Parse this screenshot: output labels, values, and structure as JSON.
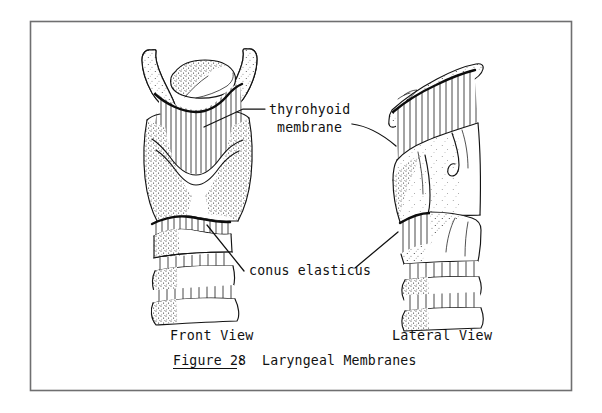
{
  "figure": {
    "border_color": "#6f6f70",
    "ink_color": "#141414",
    "background": "#ffffff",
    "annotations": {
      "thyrohyoid_line1": "thyrohyoid",
      "thyrohyoid_line2": "membrane",
      "conus": "conus elasticus"
    },
    "views": {
      "front": "Front View",
      "lateral": "Lateral View"
    },
    "caption": {
      "number": "Figure 28",
      "separator": ":",
      "title": "Laryngeal Membranes"
    }
  }
}
